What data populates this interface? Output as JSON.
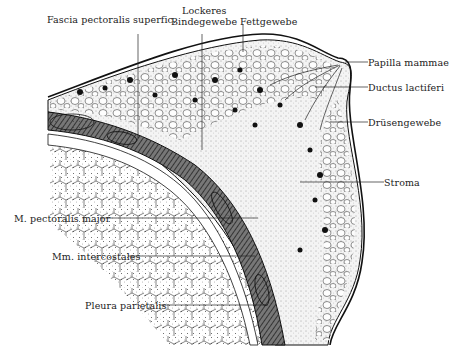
{
  "figure": {
    "type": "anatomical cross-section illustration",
    "colors": {
      "ink": "#1a1a1a",
      "paper": "#ffffff",
      "tissue": "#efefef"
    }
  },
  "labels": {
    "fascia": "Fascia pectoralis superfic.",
    "lockeres_1": "Lockeres",
    "lockeres_2": "Bindegewebe",
    "fettgewebe": "Fettgewebe",
    "papilla": "Papilla mammae",
    "ductus": "Ductus lactiferi",
    "druesen": "Drüsengewebe",
    "stroma": "Stroma",
    "pectoralis": "M. pectoralis major",
    "intercostales": "Mm. intercostales",
    "pleura": "Pleura parietalis"
  }
}
